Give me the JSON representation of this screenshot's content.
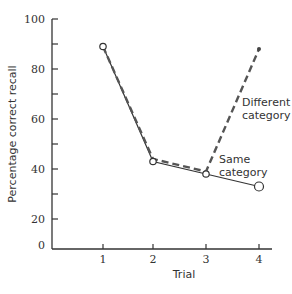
{
  "chart_data": {
    "type": "line",
    "title": "",
    "xlabel": "Trial",
    "ylabel": "Percentage correct recall",
    "x": [
      1,
      2,
      3,
      4
    ],
    "x_tick_labels": [
      "1",
      "2",
      "3",
      "4"
    ],
    "y_tick_labels": [
      "100",
      "80",
      "60",
      "40",
      "20",
      "0"
    ],
    "y_ticks": [
      100,
      90,
      80,
      70,
      60,
      50,
      40,
      30,
      20,
      0
    ],
    "ylim": [
      0,
      100
    ],
    "grid": false,
    "legend": "inline annotations",
    "series": [
      {
        "name": "Same category",
        "style": "solid",
        "marker": "open-circle",
        "values": [
          89,
          43,
          38,
          33
        ]
      },
      {
        "name": "Different category",
        "style": "dashed",
        "marker": "filled-dot",
        "values": [
          89,
          44,
          39,
          88
        ]
      }
    ],
    "annotations": [
      {
        "text_lines": [
          "Different",
          "category"
        ],
        "series": "Different category"
      },
      {
        "text_lines": [
          "Same",
          "category"
        ],
        "series": "Same category"
      }
    ]
  }
}
